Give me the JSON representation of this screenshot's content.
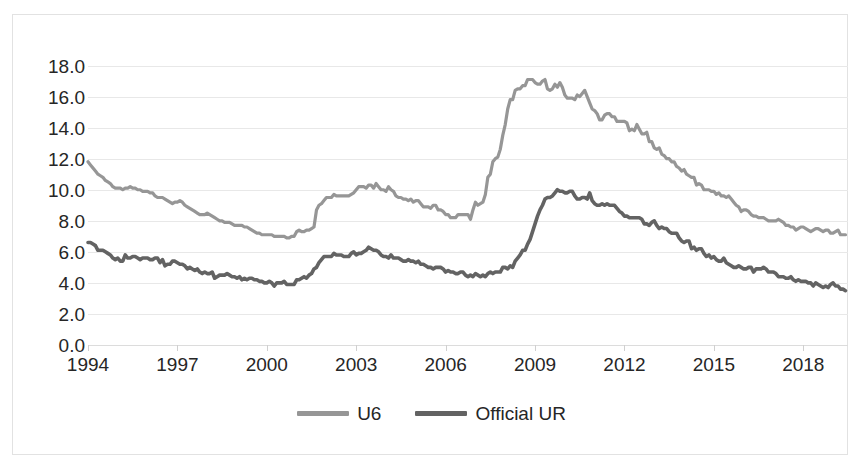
{
  "chart_data": {
    "type": "line",
    "title": "",
    "subtitle": "",
    "xlabel": "",
    "ylabel": "",
    "xlim": [
      1994.0,
      2019.5
    ],
    "ylim": [
      0.0,
      19.0
    ],
    "grid": true,
    "legend_position": "bottom-center",
    "y_ticks": [
      "18.0",
      "16.0",
      "14.0",
      "12.0",
      "10.0",
      "8.0",
      "6.0",
      "4.0",
      "2.0",
      "0.0"
    ],
    "y_tick_values": [
      18.0,
      16.0,
      14.0,
      12.0,
      10.0,
      8.0,
      6.0,
      4.0,
      2.0,
      0.0
    ],
    "x_ticks": [
      "1994",
      "1997",
      "2000",
      "2003",
      "2006",
      "2009",
      "2012",
      "2015",
      "2018"
    ],
    "x_tick_values": [
      1994,
      1997,
      2000,
      2003,
      2006,
      2009,
      2012,
      2015,
      2018
    ],
    "colors": {
      "u6": "#969696",
      "official_ur": "#636363",
      "gridline": "#e8e8e8",
      "axis_text": "#262626",
      "frame": "#e2e2e2",
      "background": "#ffffff"
    },
    "series": [
      {
        "name": "U6",
        "color": "#969696",
        "line_width": 3.2,
        "x_start": 1994.0,
        "x_step": 0.08333,
        "values": [
          11.8,
          11.6,
          11.4,
          11.2,
          11.0,
          10.9,
          10.8,
          10.6,
          10.5,
          10.4,
          10.2,
          10.1,
          10.1,
          10.1,
          10.0,
          10.1,
          10.1,
          10.2,
          10.1,
          10.1,
          10.0,
          10.0,
          9.9,
          9.9,
          9.9,
          9.8,
          9.8,
          9.6,
          9.5,
          9.5,
          9.5,
          9.4,
          9.3,
          9.2,
          9.1,
          9.2,
          9.2,
          9.3,
          9.2,
          9.0,
          8.9,
          8.8,
          8.7,
          8.6,
          8.5,
          8.4,
          8.4,
          8.4,
          8.5,
          8.4,
          8.3,
          8.2,
          8.1,
          8.0,
          8.0,
          7.9,
          7.9,
          7.9,
          7.8,
          7.7,
          7.7,
          7.7,
          7.7,
          7.6,
          7.6,
          7.5,
          7.4,
          7.3,
          7.2,
          7.2,
          7.1,
          7.1,
          7.1,
          7.1,
          7.1,
          7.0,
          7.0,
          7.0,
          7.0,
          7.0,
          6.9,
          6.9,
          7.0,
          7.0,
          7.3,
          7.4,
          7.3,
          7.3,
          7.4,
          7.4,
          7.5,
          7.6,
          8.7,
          9.0,
          9.1,
          9.3,
          9.5,
          9.5,
          9.5,
          9.7,
          9.6,
          9.6,
          9.6,
          9.6,
          9.6,
          9.6,
          9.7,
          9.8,
          10.0,
          10.2,
          10.2,
          10.2,
          10.1,
          10.3,
          10.3,
          10.1,
          10.4,
          10.2,
          10.0,
          10.0,
          9.9,
          10.2,
          10.0,
          9.9,
          9.6,
          9.5,
          9.5,
          9.4,
          9.4,
          9.3,
          9.4,
          9.2,
          9.3,
          9.3,
          9.1,
          8.9,
          8.9,
          8.9,
          8.8,
          9.0,
          9.0,
          8.7,
          8.7,
          8.6,
          8.4,
          8.4,
          8.2,
          8.2,
          8.2,
          8.4,
          8.4,
          8.4,
          8.4,
          8.4,
          8.1,
          8.7,
          9.2,
          9.0,
          9.1,
          9.2,
          9.7,
          10.8,
          11.0,
          11.8,
          12.0,
          12.1,
          12.6,
          13.5,
          14.2,
          15.2,
          15.8,
          15.8,
          16.4,
          16.5,
          16.5,
          16.7,
          16.7,
          17.1,
          17.1,
          17.1,
          16.9,
          16.8,
          16.8,
          17.0,
          17.1,
          16.5,
          16.4,
          16.5,
          16.8,
          16.6,
          16.9,
          16.6,
          16.1,
          15.9,
          15.9,
          15.9,
          15.8,
          16.1,
          16.0,
          16.2,
          16.4,
          16.0,
          15.6,
          15.2,
          15.1,
          14.9,
          14.5,
          14.5,
          14.8,
          14.9,
          14.9,
          14.7,
          14.7,
          14.4,
          14.4,
          14.4,
          14.4,
          14.3,
          13.8,
          13.9,
          13.8,
          14.2,
          13.9,
          13.6,
          13.6,
          13.7,
          13.1,
          13.1,
          12.7,
          12.6,
          12.7,
          12.3,
          12.2,
          12.0,
          12.0,
          11.8,
          11.8,
          11.5,
          11.4,
          11.2,
          11.3,
          11.0,
          10.9,
          10.8,
          10.8,
          10.3,
          10.4,
          10.3,
          10.0,
          10.0,
          10.0,
          9.9,
          9.9,
          9.7,
          9.8,
          9.6,
          9.6,
          9.5,
          9.6,
          9.4,
          9.2,
          9.0,
          8.9,
          8.6,
          8.7,
          8.7,
          8.6,
          8.4,
          8.3,
          8.3,
          8.2,
          8.2,
          8.2,
          8.1,
          8.0,
          8.0,
          8.0,
          8.0,
          8.1,
          8.0,
          7.9,
          7.7,
          7.7,
          7.6,
          7.6,
          7.4,
          7.5,
          7.6,
          7.6,
          7.5,
          7.4,
          7.3,
          7.4,
          7.5,
          7.5,
          7.4,
          7.3,
          7.4,
          7.4,
          7.2,
          7.2,
          7.3,
          7.4,
          7.1,
          7.1,
          7.1
        ]
      },
      {
        "name": "Official UR",
        "color": "#636363",
        "line_width": 3.6,
        "x_start": 1994.0,
        "x_step": 0.08333,
        "values": [
          6.6,
          6.6,
          6.5,
          6.4,
          6.1,
          6.1,
          6.1,
          6.0,
          5.9,
          5.8,
          5.6,
          5.5,
          5.6,
          5.4,
          5.4,
          5.8,
          5.6,
          5.6,
          5.7,
          5.7,
          5.6,
          5.5,
          5.6,
          5.6,
          5.6,
          5.5,
          5.5,
          5.6,
          5.6,
          5.3,
          5.5,
          5.1,
          5.2,
          5.2,
          5.4,
          5.4,
          5.3,
          5.2,
          5.2,
          5.1,
          4.9,
          5.0,
          4.9,
          4.8,
          4.9,
          4.7,
          4.6,
          4.7,
          4.6,
          4.6,
          4.7,
          4.3,
          4.4,
          4.5,
          4.5,
          4.5,
          4.6,
          4.5,
          4.4,
          4.4,
          4.3,
          4.4,
          4.2,
          4.3,
          4.2,
          4.3,
          4.3,
          4.2,
          4.2,
          4.1,
          4.1,
          4.0,
          4.0,
          4.1,
          4.0,
          3.8,
          4.0,
          4.0,
          4.0,
          4.1,
          3.9,
          3.9,
          3.9,
          3.9,
          4.2,
          4.2,
          4.3,
          4.4,
          4.3,
          4.5,
          4.6,
          4.9,
          5.0,
          5.3,
          5.5,
          5.7,
          5.7,
          5.7,
          5.7,
          5.9,
          5.8,
          5.8,
          5.8,
          5.7,
          5.7,
          5.7,
          5.9,
          6.0,
          5.8,
          5.9,
          5.9,
          6.0,
          6.1,
          6.3,
          6.2,
          6.1,
          6.1,
          6.0,
          5.8,
          5.7,
          5.7,
          5.6,
          5.8,
          5.6,
          5.6,
          5.6,
          5.5,
          5.4,
          5.4,
          5.5,
          5.4,
          5.4,
          5.3,
          5.4,
          5.2,
          5.2,
          5.1,
          5.0,
          5.0,
          4.9,
          5.0,
          5.0,
          5.0,
          4.9,
          4.7,
          4.8,
          4.7,
          4.7,
          4.6,
          4.6,
          4.7,
          4.7,
          4.5,
          4.4,
          4.5,
          4.4,
          4.6,
          4.5,
          4.4,
          4.5,
          4.4,
          4.6,
          4.7,
          4.6,
          4.7,
          4.7,
          4.7,
          5.0,
          5.0,
          4.9,
          5.1,
          5.0,
          5.4,
          5.6,
          5.8,
          6.1,
          6.1,
          6.5,
          6.8,
          7.3,
          7.8,
          8.3,
          8.7,
          9.0,
          9.4,
          9.5,
          9.5,
          9.6,
          9.8,
          10.0,
          9.9,
          9.9,
          9.8,
          9.8,
          9.9,
          9.9,
          9.6,
          9.4,
          9.4,
          9.5,
          9.5,
          9.4,
          9.8,
          9.3,
          9.1,
          9.0,
          9.0,
          9.1,
          9.0,
          9.1,
          9.0,
          9.0,
          9.0,
          8.8,
          8.6,
          8.5,
          8.3,
          8.3,
          8.2,
          8.2,
          8.2,
          8.2,
          8.2,
          8.1,
          7.8,
          7.8,
          7.7,
          7.9,
          8.0,
          7.7,
          7.5,
          7.6,
          7.5,
          7.5,
          7.3,
          7.2,
          7.2,
          7.2,
          6.9,
          6.7,
          6.6,
          6.7,
          6.7,
          6.2,
          6.3,
          6.1,
          6.2,
          6.2,
          5.9,
          5.7,
          5.8,
          5.6,
          5.7,
          5.5,
          5.4,
          5.4,
          5.6,
          5.3,
          5.2,
          5.1,
          5.0,
          5.0,
          5.1,
          5.0,
          4.9,
          4.9,
          5.0,
          5.0,
          4.7,
          4.9,
          4.9,
          4.9,
          5.0,
          4.9,
          4.7,
          4.7,
          4.7,
          4.6,
          4.4,
          4.4,
          4.4,
          4.3,
          4.3,
          4.4,
          4.2,
          4.1,
          4.2,
          4.1,
          4.1,
          4.1,
          4.0,
          4.0,
          3.8,
          4.0,
          3.9,
          3.8,
          3.7,
          3.8,
          3.7,
          3.9,
          4.0,
          3.8,
          3.8,
          3.6,
          3.6,
          3.5
        ]
      }
    ]
  },
  "legend": {
    "entries": [
      {
        "label": "U6",
        "color": "#969696"
      },
      {
        "label": "Official UR",
        "color": "#636363"
      }
    ]
  }
}
